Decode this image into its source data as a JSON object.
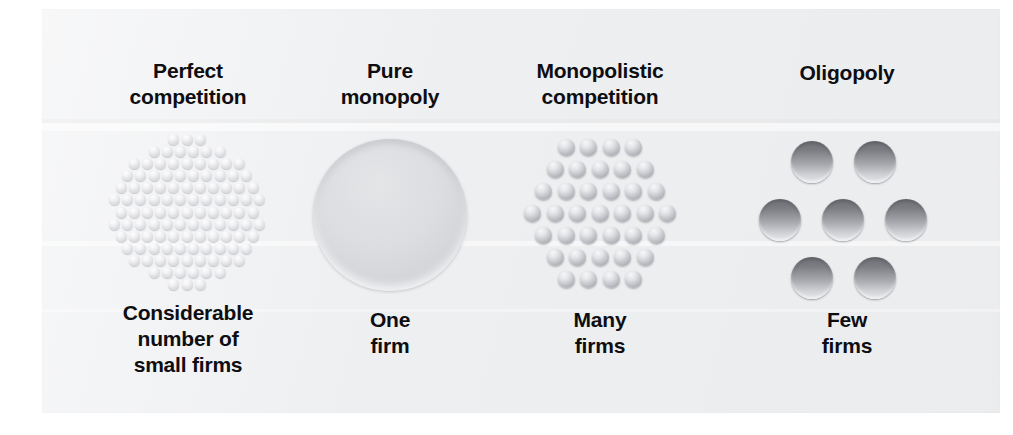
{
  "figure": {
    "name": "market-structure-spectrum",
    "background_color": "#ffffff",
    "panel_color": "#eeeff1"
  },
  "columns": [
    {
      "id": "perfect-competition",
      "title": "Perfect\ncompetition",
      "caption": "Considerable\nnumber of\nsmall firms",
      "symbol": "many-tiny-dots",
      "firm_count_label": "Considerable number of small firms",
      "dot_color": "#e4e5e8",
      "dot_size": "tiny",
      "dot_count": 137
    },
    {
      "id": "pure-monopoly",
      "title": "Pure\nmonopoly",
      "caption": "One\nfirm",
      "symbol": "single-large-circle",
      "firm_count_label": "One firm",
      "dot_color": "#d8d9dc",
      "dot_size": "huge",
      "dot_count": 1
    },
    {
      "id": "monopolistic-competition",
      "title": "Monopolistic\ncompetition",
      "caption": "Many\nfirms",
      "symbol": "many-medium-dots",
      "firm_count_label": "Many firms",
      "dot_color": "#b5b7bd",
      "dot_size": "medium",
      "dot_count": 42
    },
    {
      "id": "oligopoly",
      "title": "Oligopoly",
      "caption": "Few\nfirms",
      "symbol": "seven-large-dots",
      "firm_count_label": "Few firms",
      "dot_color": "#7b7d83",
      "dot_size": "large",
      "dot_count": 7
    }
  ],
  "chart_data": {
    "type": "bar",
    "categories": [
      "Perfect competition",
      "Pure monopoly",
      "Monopolistic competition",
      "Oligopoly"
    ],
    "values": [
      137,
      1,
      42,
      7
    ],
    "xlabel": "Market structure",
    "ylabel": "Number of firms depicted",
    "ylim": [
      0,
      140
    ],
    "grid": false,
    "legend": "none",
    "annotations": [
      "Considerable number of small firms",
      "One firm",
      "Many firms",
      "Few firms"
    ]
  }
}
